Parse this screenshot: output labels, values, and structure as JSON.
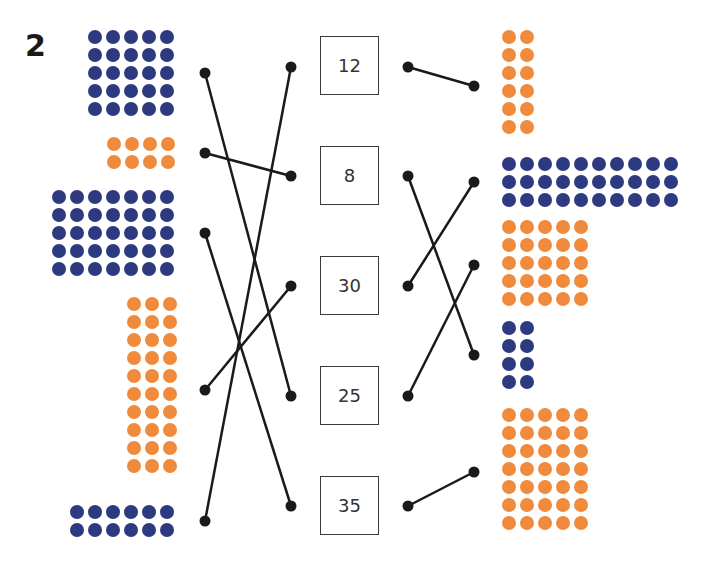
{
  "question_number": "2",
  "colors": {
    "navy": "#2d3a80",
    "orange": "#f08a3c",
    "line": "#1a1a1a"
  },
  "left_groups": [
    {
      "id": "L1",
      "color": "navy",
      "cols": 5,
      "rows": 5,
      "count": 25,
      "x": 88,
      "y": 30
    },
    {
      "id": "L2",
      "color": "orange",
      "cols": 4,
      "rows": 2,
      "count": 8,
      "x": 107,
      "y": 137
    },
    {
      "id": "L3",
      "color": "navy",
      "cols": 7,
      "rows": 5,
      "count": 35,
      "x": 52,
      "y": 190
    },
    {
      "id": "L4",
      "color": "orange",
      "cols": 3,
      "rows": 10,
      "count": 30,
      "x": 127,
      "y": 297
    },
    {
      "id": "L5",
      "color": "navy",
      "cols": 6,
      "rows": 2,
      "count": 12,
      "x": 70,
      "y": 505
    }
  ],
  "number_boxes": [
    {
      "label": "12",
      "x": 320,
      "y": 36
    },
    {
      "label": "8",
      "x": 320,
      "y": 146
    },
    {
      "label": "30",
      "x": 320,
      "y": 256
    },
    {
      "label": "25",
      "x": 320,
      "y": 366
    },
    {
      "label": "35",
      "x": 320,
      "y": 476
    }
  ],
  "right_groups": [
    {
      "id": "R1",
      "color": "orange",
      "cols": 2,
      "rows": 6,
      "count": 12,
      "x": 502,
      "y": 30
    },
    {
      "id": "R2",
      "color": "navy",
      "cols": 10,
      "rows": 3,
      "count": 30,
      "x": 502,
      "y": 157
    },
    {
      "id": "R3",
      "color": "orange",
      "cols": 5,
      "rows": 5,
      "count": 25,
      "x": 502,
      "y": 220
    },
    {
      "id": "R4",
      "color": "navy",
      "cols": 2,
      "rows": 4,
      "count": 8,
      "x": 502,
      "y": 321
    },
    {
      "id": "R5",
      "color": "orange",
      "cols": 5,
      "rows": 7,
      "count": 35,
      "x": 502,
      "y": 408
    }
  ],
  "left_connections": [
    {
      "from": "L1",
      "to": "25",
      "x1": 205,
      "y1": 73,
      "x2": 291,
      "y2": 396
    },
    {
      "from": "L2",
      "to": "8",
      "x1": 205,
      "y1": 153,
      "x2": 291,
      "y2": 176
    },
    {
      "from": "L3",
      "to": "35",
      "x1": 205,
      "y1": 233,
      "x2": 291,
      "y2": 506
    },
    {
      "from": "L4",
      "to": "30",
      "x1": 205,
      "y1": 390,
      "x2": 291,
      "y2": 286
    },
    {
      "from": "L5",
      "to": "12",
      "x1": 205,
      "y1": 521,
      "x2": 291,
      "y2": 67
    }
  ],
  "right_connections": [
    {
      "from": "12",
      "to": "R1",
      "x1": 408,
      "y1": 67,
      "x2": 474,
      "y2": 86
    },
    {
      "from": "8",
      "to": "R4",
      "x1": 408,
      "y1": 176,
      "x2": 474,
      "y2": 355
    },
    {
      "from": "30",
      "to": "R2",
      "x1": 408,
      "y1": 286,
      "x2": 474,
      "y2": 182
    },
    {
      "from": "25",
      "to": "R3",
      "x1": 408,
      "y1": 396,
      "x2": 474,
      "y2": 265
    },
    {
      "from": "35",
      "to": "R5",
      "x1": 408,
      "y1": 506,
      "x2": 474,
      "y2": 472
    }
  ]
}
